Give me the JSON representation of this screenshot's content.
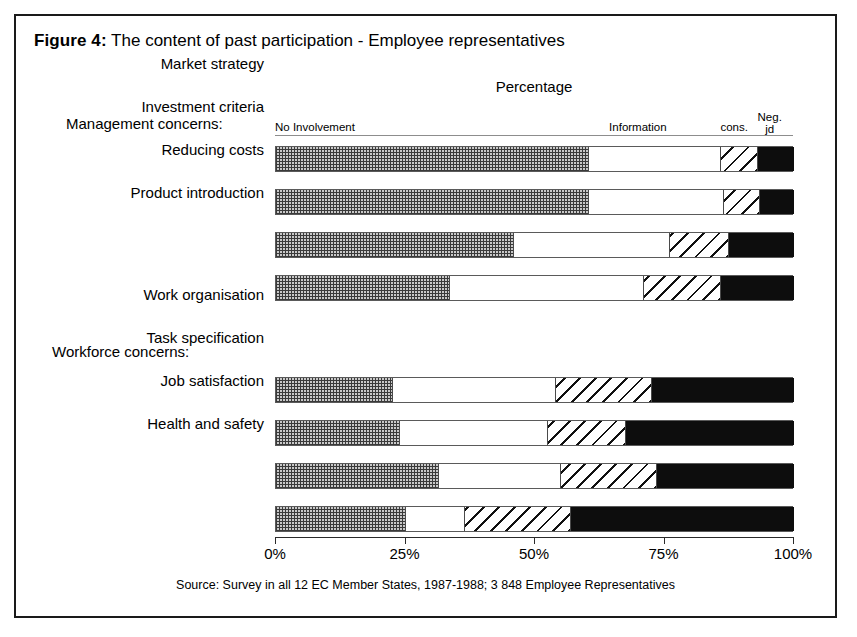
{
  "figure": {
    "label": "Figure 4:",
    "title": "The content of past participation - Employee representatives",
    "axis_title": "Percentage",
    "source": "Source: Survey in all 12 EC Member States, 1987-1988; 3 848 Employee Representatives"
  },
  "legend": [
    {
      "key": "no_involvement",
      "label": "No Involvement",
      "left_pct": 0,
      "align": "left",
      "fill": "checker-gray"
    },
    {
      "key": "information",
      "label": "Information",
      "left_pct": 64.5,
      "align": "left",
      "fill": "white"
    },
    {
      "key": "consultation",
      "label": "cons.",
      "left_pct": 86.0,
      "align": "left",
      "fill": "diagonal-hatch"
    },
    {
      "key": "negotiation",
      "label": "Neg.\njd",
      "left_pct": 95.5,
      "align": "center",
      "fill": "black"
    }
  ],
  "groups": [
    {
      "key": "management",
      "caption": "Management concerns:"
    },
    {
      "key": "workforce",
      "caption": "Workforce concerns:"
    }
  ],
  "axis": {
    "ticks": [
      {
        "value": 0,
        "label": "0%"
      },
      {
        "value": 25,
        "label": "25%"
      },
      {
        "value": 50,
        "label": "50%"
      },
      {
        "value": 75,
        "label": "75%"
      },
      {
        "value": 100,
        "label": "100%"
      }
    ],
    "min": 0,
    "max": 100
  },
  "colors": {
    "frame": "#1a1a1a",
    "bar_outline": "#5a5a5a",
    "no_involvement": "#c9c9c9",
    "information": "#ffffff",
    "consultation": "#ffffff",
    "negotiation": "#0d0d0d"
  },
  "chart_data": {
    "type": "bar",
    "orientation": "horizontal",
    "stacked": true,
    "normalized": true,
    "title": "Figure 4: The content of past participation - Employee representatives",
    "subtitle": "Percentage",
    "xlabel": "Percentage",
    "ylabel": "",
    "xlim": [
      0,
      100
    ],
    "xticks": [
      0,
      25,
      50,
      75,
      100
    ],
    "xticklabels": [
      "0%",
      "25%",
      "50%",
      "75%",
      "100%"
    ],
    "grid": false,
    "legend_position": "top",
    "legend_entries": [
      "No Involvement",
      "Information",
      "cons.",
      "Neg. jd"
    ],
    "series": [
      {
        "name": "No Involvement",
        "values": [
          60.5,
          60.5,
          46.0,
          33.5,
          22.5,
          24.0,
          31.5,
          25.0
        ]
      },
      {
        "name": "Information",
        "values": [
          25.5,
          26.0,
          30.0,
          37.5,
          31.5,
          28.5,
          23.5,
          11.5
        ]
      },
      {
        "name": "cons.",
        "values": [
          7.0,
          7.0,
          11.5,
          15.0,
          18.5,
          15.0,
          18.5,
          20.5
        ]
      },
      {
        "name": "Neg. jd",
        "values": [
          7.0,
          6.5,
          12.5,
          14.0,
          27.5,
          32.5,
          26.5,
          43.0
        ]
      }
    ],
    "categories": [
      "Market strategy",
      "Investment criteria",
      "Reducing costs",
      "Product introduction",
      "Work organisation",
      "Task specification",
      "Job satisfaction",
      "Health and safety"
    ],
    "category_groups": [
      {
        "caption": "Management concerns:",
        "categories": [
          "Market strategy",
          "Investment criteria",
          "Reducing costs",
          "Product introduction"
        ]
      },
      {
        "caption": "Workforce concerns:",
        "categories": [
          "Work organisation",
          "Task specification",
          "Job satisfaction",
          "Health and safety"
        ]
      }
    ],
    "annotations": [
      "Source: Survey in all 12 EC Member States, 1987-1988; 3 848 Employee Representatives"
    ]
  },
  "rows": [
    {
      "label": "Market strategy",
      "top": 34,
      "segments": [
        60.5,
        25.5,
        7.0,
        7.0
      ]
    },
    {
      "label": "Investment criteria",
      "top": 77,
      "segments": [
        60.5,
        26.0,
        7.0,
        6.5
      ]
    },
    {
      "label": "Reducing costs",
      "top": 120,
      "segments": [
        46.0,
        30.0,
        11.5,
        12.5
      ]
    },
    {
      "label": "Product introduction",
      "top": 163,
      "segments": [
        33.5,
        37.5,
        15.0,
        14.0
      ]
    },
    {
      "label": "Work organisation",
      "top": 265,
      "segments": [
        22.5,
        31.5,
        18.5,
        27.5
      ]
    },
    {
      "label": "Task specification",
      "top": 308,
      "segments": [
        24.0,
        28.5,
        15.0,
        32.5
      ]
    },
    {
      "label": "Job satisfaction",
      "top": 351,
      "segments": [
        31.5,
        23.5,
        18.5,
        26.5
      ]
    },
    {
      "label": "Health and safety",
      "top": 394,
      "segments": [
        25.0,
        11.5,
        20.5,
        43.0
      ]
    }
  ]
}
